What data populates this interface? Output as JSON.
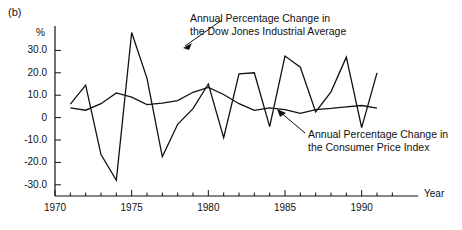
{
  "figure": {
    "panel_label": "(b)",
    "unit_label": "%",
    "xaxis_title": "Year"
  },
  "annotations": [
    {
      "id": "djia",
      "line1": "Annual Percentage Change in",
      "line2": "the Dow Jones Industrial Average"
    },
    {
      "id": "cpi",
      "line1": "Annual Percentage Change in",
      "line2": "the Consumer Price Index"
    }
  ],
  "chart_data": {
    "type": "line",
    "title": "",
    "subtitle": "",
    "xlabel": "Year",
    "ylabel": "%",
    "xlim": [
      1970,
      1992.5
    ],
    "ylim": [
      -35,
      40
    ],
    "grid": false,
    "legend_position": "inline-annotations",
    "ytick_labels": [
      "30.0",
      "20.0",
      "10.0",
      "0",
      "-10.0",
      "-20.0",
      "-30.0"
    ],
    "ytick_values": [
      30,
      20,
      10,
      0,
      -10,
      -20,
      -30
    ],
    "xtick_labels": [
      "1970",
      "1975",
      "1980",
      "1985",
      "1990"
    ],
    "xtick_values": [
      1970,
      1975,
      1980,
      1985,
      1990
    ],
    "xminor_step": 1,
    "x": [
      1971,
      1972,
      1973,
      1974,
      1975,
      1976,
      1977,
      1978,
      1979,
      1980,
      1981,
      1982,
      1983,
      1984,
      1985,
      1986,
      1987,
      1988,
      1989,
      1990,
      1991
    ],
    "series": [
      {
        "name": "Annual Percentage Change in the Dow Jones Industrial Average",
        "color": "#111111",
        "values": [
          6.0,
          14.5,
          -16.5,
          -28.0,
          38.0,
          17.5,
          -17.5,
          -3.0,
          4.0,
          15.0,
          -9.0,
          19.5,
          20.0,
          -4.0,
          27.5,
          22.5,
          2.5,
          11.5,
          27.0,
          -4.5,
          20.0
        ]
      },
      {
        "name": "Annual Percentage Change in the Consumer Price Index",
        "color": "#111111",
        "values": [
          4.3,
          3.3,
          6.2,
          11.0,
          9.1,
          5.8,
          6.5,
          7.6,
          11.3,
          13.5,
          10.3,
          6.2,
          3.2,
          4.3,
          3.6,
          1.9,
          3.6,
          4.1,
          4.8,
          5.4,
          4.2
        ]
      }
    ]
  }
}
